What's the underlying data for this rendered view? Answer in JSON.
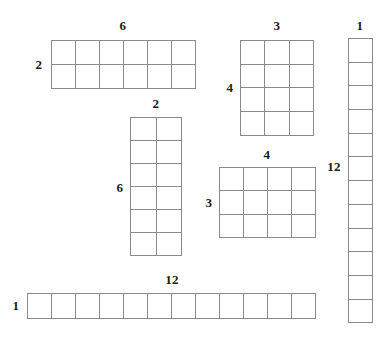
{
  "page": {
    "background_color": "#ffffff",
    "line_color": "#8a8a8a",
    "label_color": "#1a1a1a"
  },
  "arrays": [
    {
      "id": "array-6x2",
      "name": "array-6-by-2",
      "cols": 6,
      "rows": 2,
      "top_label": "6",
      "left_label": "2",
      "x": 51,
      "y": 40,
      "cell_w": 24,
      "cell_h": 24,
      "top_label_x": 123,
      "top_label_y": 25,
      "left_label_x": 39,
      "left_label_y": 64
    },
    {
      "id": "array-3x4",
      "name": "array-3-by-4",
      "cols": 3,
      "rows": 4,
      "top_label": "3",
      "left_label": "4",
      "x": 240,
      "y": 40,
      "cell_w": 24.3,
      "cell_h": 23.7,
      "top_label_x": 277,
      "top_label_y": 25,
      "left_label_x": 230,
      "left_label_y": 87
    },
    {
      "id": "array-1x12",
      "name": "array-1-by-12",
      "cols": 1,
      "rows": 12,
      "top_label": "1",
      "left_label": "12",
      "x": 348,
      "y": 38,
      "cell_w": 24,
      "cell_h": 23.7,
      "top_label_x": 360,
      "top_label_y": 25,
      "left_label_x": 334,
      "left_label_y": 166
    },
    {
      "id": "array-2x6",
      "name": "array-2-by-6",
      "cols": 2,
      "rows": 6,
      "top_label": "2",
      "left_label": "6",
      "x": 130,
      "y": 117,
      "cell_w": 25.5,
      "cell_h": 23,
      "top_label_x": 156,
      "top_label_y": 103,
      "left_label_x": 120,
      "left_label_y": 187
    },
    {
      "id": "array-4x3",
      "name": "array-4-by-3",
      "cols": 4,
      "rows": 3,
      "top_label": "4",
      "left_label": "3",
      "x": 219,
      "y": 167,
      "cell_w": 24,
      "cell_h": 23.3,
      "top_label_x": 267,
      "top_label_y": 154,
      "left_label_x": 209,
      "left_label_y": 202
    },
    {
      "id": "array-12x1",
      "name": "array-12-by-1",
      "cols": 12,
      "rows": 1,
      "top_label": "12",
      "left_label": "1",
      "x": 27,
      "y": 293,
      "cell_w": 24,
      "cell_h": 25,
      "top_label_x": 172,
      "top_label_y": 279,
      "left_label_x": 16,
      "left_label_y": 305
    }
  ]
}
